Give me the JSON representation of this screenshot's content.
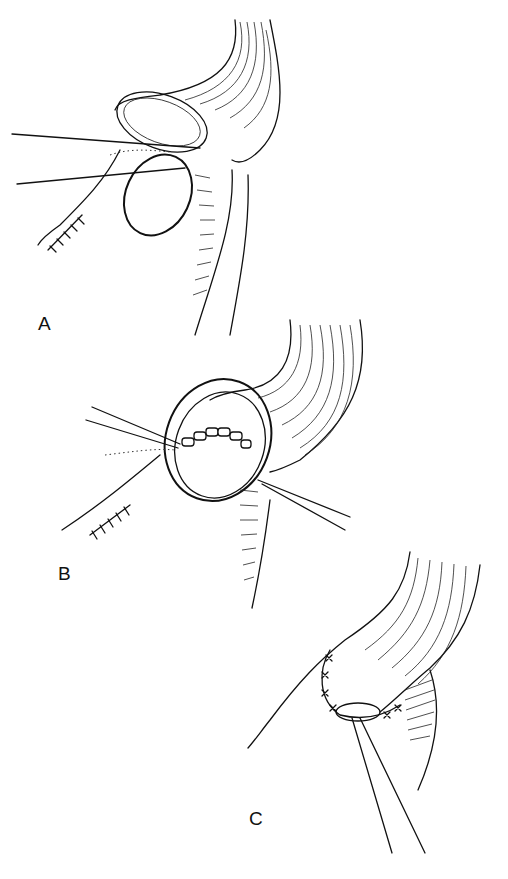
{
  "figure": {
    "panels": [
      {
        "id": "A",
        "label": "A",
        "description": "Bowel end with two stay sutures held near stoma opening"
      },
      {
        "id": "B",
        "label": "B",
        "description": "Mucosa sutured to skin edge around stoma opening with traction sutures"
      },
      {
        "id": "C",
        "label": "C",
        "description": "Completed closure with interrupted sutures; forceps at stoma"
      }
    ],
    "colors": {
      "ink": "#111111",
      "background": "#ffffff"
    }
  }
}
